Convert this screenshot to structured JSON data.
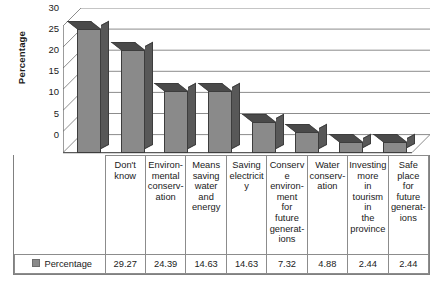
{
  "chart_data": {
    "type": "bar",
    "title": "",
    "xlabel": "",
    "ylabel": "Percentage",
    "ylim": [
      0,
      30
    ],
    "yticks": [
      0,
      5,
      10,
      15,
      20,
      25,
      30
    ],
    "grid": true,
    "legend_position": "table-left",
    "categories": [
      "Don't know",
      "Environmental conservation",
      "Means saving water and energy",
      "Saving electricity",
      "Conserve environment for future generations",
      "Water conservation",
      "Investing more in tourism in the province",
      "Safe place for future generations"
    ],
    "series": [
      {
        "name": "Percentage",
        "values": [
          29.27,
          24.39,
          14.63,
          14.63,
          7.32,
          4.88,
          2.44,
          2.44
        ]
      }
    ]
  },
  "table": {
    "series_label": "Percentage",
    "legend_swatch_color": "#8a8a8a",
    "category_cells": [
      "Don't know",
      "Environ- mental conserv- ation",
      "Means saving water and energy",
      "Saving electricity",
      "Conserve environ- ment for future generat- ions",
      "Water conserv- ation",
      "Investing more in tourism in the province",
      "Safe place for future generat- ions"
    ],
    "value_cells": [
      "29.27",
      "24.39",
      "14.63",
      "14.63",
      "7.32",
      "4.88",
      "2.44",
      "2.44"
    ]
  },
  "axis": {
    "y_title": "Percentage",
    "y_tick_labels": [
      "30",
      "25",
      "20",
      "15",
      "10",
      "5",
      "0"
    ]
  },
  "colors": {
    "bar_front": "#8a8a8a",
    "bar_side": "#585858",
    "bar_top": "#4a4a4a",
    "bar_edge": "#3d3d3d",
    "grid_line": "#8c8c8c",
    "table_border": "#8c8c8c"
  }
}
